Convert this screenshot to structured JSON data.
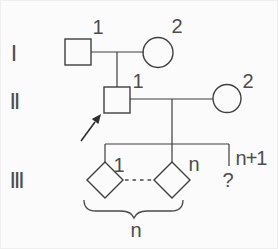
{
  "diagram_type": "pedigree-chart",
  "colors": {
    "line": "#3f3f3f",
    "text": "#4d4d4d",
    "affected_fill": "#0b0b0b",
    "unaffected_fill": "none",
    "background": "#fbfbfb"
  },
  "generations": [
    {
      "label": "Ⅰ",
      "individuals": [
        {
          "label": "1",
          "symbol": "square",
          "sex": "male",
          "affected": false
        },
        {
          "label": "2",
          "symbol": "circle",
          "sex": "female",
          "affected": true
        }
      ]
    },
    {
      "label": "Ⅱ",
      "individuals": [
        {
          "label": "1",
          "symbol": "square",
          "sex": "male",
          "affected": false,
          "proband": true
        },
        {
          "label": "2",
          "symbol": "circle",
          "sex": "female",
          "affected": false
        }
      ]
    },
    {
      "label": "Ⅲ",
      "individuals": [
        {
          "label": "1",
          "symbol": "diamond",
          "sex": "unknown"
        },
        {
          "label": "n",
          "symbol": "diamond",
          "sex": "unknown"
        },
        {
          "label": "n+1",
          "symbol": "question-mark",
          "display": "?"
        }
      ]
    }
  ],
  "annotations": {
    "brace_count": "n"
  }
}
